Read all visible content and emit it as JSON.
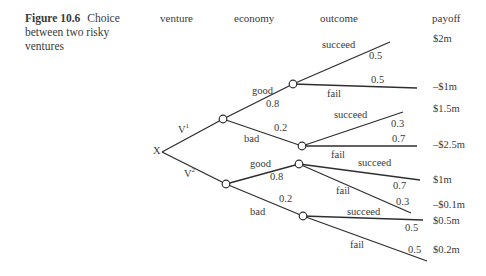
{
  "caption": {
    "figure_label": "Figure 10.6",
    "text": "Choice between two risky ventures"
  },
  "headers": {
    "venture": "venture",
    "economy": "economy",
    "outcome": "outcome",
    "payoff": "payoff"
  },
  "root": {
    "label": "X"
  },
  "ventures": [
    {
      "label": "V",
      "superscript": "1",
      "economy": [
        {
          "label": "good",
          "prob": "0.8",
          "outcomes": [
            {
              "label": "succeed",
              "prob": "0.5",
              "payoff": "$2m"
            },
            {
              "label": "fail",
              "prob": "0.5",
              "payoff": "–$1m"
            }
          ]
        },
        {
          "label": "bad",
          "prob": "0.2",
          "outcomes": [
            {
              "label": "succeed",
              "prob": "0.3",
              "payoff": "$1.5m"
            },
            {
              "label": "fail",
              "prob": "0.7",
              "payoff": "–$2.5m"
            }
          ]
        }
      ]
    },
    {
      "label": "V",
      "superscript": "2",
      "economy": [
        {
          "label": "good",
          "prob": "0.8",
          "outcomes": [
            {
              "label": "succeed",
              "prob": "0.7",
              "payoff": "$1m"
            },
            {
              "label": "fail",
              "prob": "0.3",
              "payoff": "–$0.1m"
            }
          ]
        },
        {
          "label": "bad",
          "prob": "0.2",
          "outcomes": [
            {
              "label": "succeed",
              "prob": "0.5",
              "payoff": "$0.5m"
            },
            {
              "label": "fail",
              "prob": "0.5",
              "payoff": "$0.2m"
            }
          ]
        }
      ]
    }
  ],
  "colors": {
    "line": "#2e2e2e",
    "text": "#3a3a3a",
    "background": "#ffffff"
  }
}
